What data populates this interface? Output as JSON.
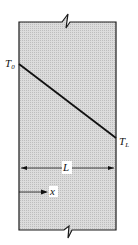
{
  "diagram": {
    "type": "plane wall temperature profile",
    "labels": {
      "left_temp": "T",
      "left_temp_sub": "0",
      "right_temp": "T",
      "right_temp_sub": "L",
      "thickness": "L",
      "coordinate": "x"
    },
    "colors": {
      "wall_fill": "#d4d4d4",
      "line": "#1a1a1a",
      "background": "#ffffff"
    },
    "profile": {
      "description": "linear temperature decrease from T0 at x=0 to TL at x=L",
      "start": {
        "x": 0,
        "T": "T0"
      },
      "end": {
        "x": "L",
        "T": "TL"
      }
    }
  }
}
